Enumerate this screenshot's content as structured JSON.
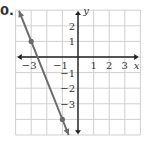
{
  "problem": {
    "number_label": "0."
  },
  "chart_data": {
    "type": "line",
    "title": "",
    "xlabel": "x",
    "ylabel": "y",
    "xlim": [
      -4,
      4
    ],
    "ylim": [
      -5,
      3
    ],
    "grid": true,
    "x_ticks": [
      "-3",
      "-1",
      "1",
      "2",
      "3"
    ],
    "y_ticks": [
      "2",
      "1",
      "-1",
      "-2",
      "-3"
    ],
    "series": [
      {
        "name": "line",
        "equation": "y = -5/2 x - 13/2",
        "points": [
          [
            -3,
            1
          ],
          [
            -1,
            -4
          ]
        ],
        "color": "#6b6b6b"
      }
    ]
  },
  "colors": {
    "grid": "#cfcfcf",
    "axis": "#222222",
    "line": "#6b6b6b",
    "point": "#6b6b6b"
  }
}
